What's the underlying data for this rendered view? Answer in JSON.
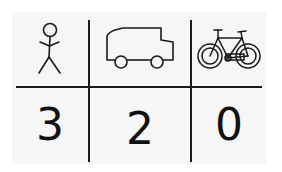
{
  "table": {
    "headers": [
      {
        "icon": "stick-figure-person-icon",
        "label": "person"
      },
      {
        "icon": "truck-icon",
        "label": "truck"
      },
      {
        "icon": "bicycle-icon",
        "label": "bicycle"
      }
    ],
    "values": [
      "3",
      "2",
      "0"
    ]
  },
  "colors": {
    "line": "#1a1a1a",
    "background": "#f6f6f6"
  }
}
